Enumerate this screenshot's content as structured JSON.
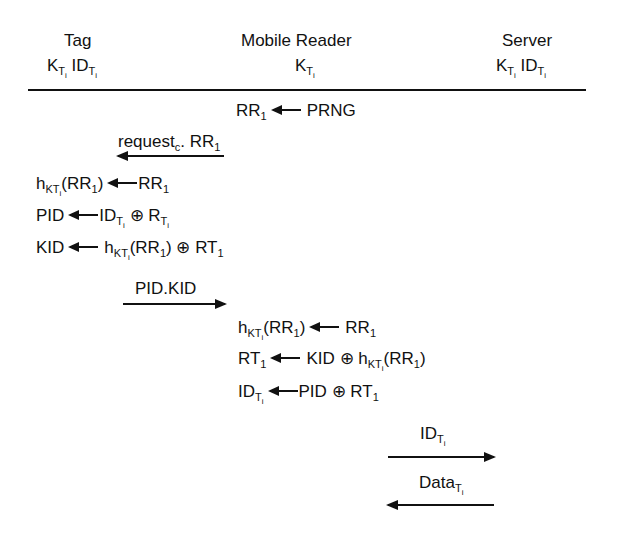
{
  "header": {
    "tag": {
      "title": "Tag",
      "keys": "K_Ti ID_Ti"
    },
    "reader": {
      "title": "Mobile Reader",
      "keys": "K_Ti"
    },
    "server": {
      "title": "Server",
      "keys": "K_Ti ID_Ti"
    }
  },
  "steps": [
    {
      "id": "s1",
      "actor": "reader",
      "lhs": "RR1",
      "rhs": "PRNG"
    },
    {
      "id": "m1",
      "type": "message",
      "direction": "reader-to-tag",
      "label": "request_c. RR1"
    },
    {
      "id": "s2",
      "actor": "tag",
      "lhs": "h_KTi(RR1)",
      "rhs": "RR1"
    },
    {
      "id": "s3",
      "actor": "tag",
      "lhs": "PID",
      "rhs": "ID_Ti ⊕ R_Ti"
    },
    {
      "id": "s4",
      "actor": "tag",
      "lhs": "KID",
      "rhs": "h_KTi(RR1) ⊕ RT1"
    },
    {
      "id": "m2",
      "type": "message",
      "direction": "tag-to-reader",
      "label": "PID.KID"
    },
    {
      "id": "s5",
      "actor": "reader",
      "lhs": "h_KTi(RR1)",
      "rhs": "RR1"
    },
    {
      "id": "s6",
      "actor": "reader",
      "lhs": "RT1",
      "rhs": "KID ⊕ h_KTi(RR1)"
    },
    {
      "id": "s7",
      "actor": "reader",
      "lhs": "ID_Ti",
      "rhs": "PID ⊕ RT1"
    },
    {
      "id": "m3",
      "type": "message",
      "direction": "reader-to-server",
      "label": "ID_Ti"
    },
    {
      "id": "m4",
      "type": "message",
      "direction": "server-to-reader",
      "label": "Data_Ti"
    }
  ],
  "text": {
    "tag": "Tag",
    "reader": "Mobile Reader",
    "server": "Server",
    "K": "K",
    "ID": "ID",
    "T": "T",
    "i": "i",
    "KT": "KT",
    "RR": "RR",
    "one": "1",
    "PRNG": "PRNG",
    "request": "request",
    "c": "c",
    "dotRR": ". RR",
    "h": "h",
    "PID": "PID",
    "KID": "KID",
    "RT": "RT",
    "R": "R",
    "xor": "⊕",
    "openRR": "(RR",
    "close": ")",
    "PIDKID": "PID.KID",
    "Data": "Data"
  }
}
